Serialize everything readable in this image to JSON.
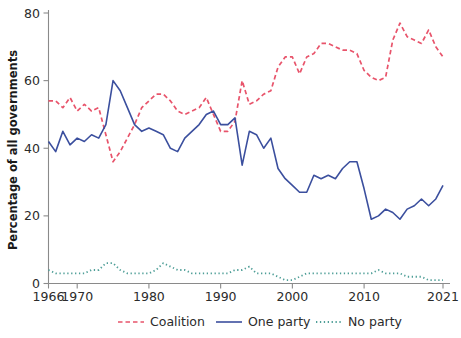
{
  "chart_data": {
    "type": "line",
    "title": "",
    "xlabel": "",
    "ylabel": "Percentage of all governments",
    "xlim": [
      1966,
      2021
    ],
    "ylim": [
      0,
      80
    ],
    "grid": false,
    "legend_position": "bottom",
    "x_ticks": [
      "1966",
      "1970",
      "1980",
      "1990",
      "2000",
      "2010",
      "2021"
    ],
    "x_tick_values": [
      1966,
      1970,
      1980,
      1990,
      2000,
      2010,
      2021
    ],
    "y_ticks": [
      "0",
      "20",
      "40",
      "60",
      "80"
    ],
    "y_tick_values": [
      0,
      20,
      40,
      60,
      80
    ],
    "x": [
      1966,
      1967,
      1968,
      1969,
      1970,
      1971,
      1972,
      1973,
      1974,
      1975,
      1976,
      1977,
      1978,
      1979,
      1980,
      1981,
      1982,
      1983,
      1984,
      1985,
      1986,
      1987,
      1988,
      1989,
      1990,
      1991,
      1992,
      1993,
      1994,
      1995,
      1996,
      1997,
      1998,
      1999,
      2000,
      2001,
      2002,
      2003,
      2004,
      2005,
      2006,
      2007,
      2008,
      2009,
      2010,
      2011,
      2012,
      2013,
      2014,
      2015,
      2016,
      2017,
      2018,
      2019,
      2020,
      2021
    ],
    "series": [
      {
        "name": "Coalition",
        "color": "#e8546b",
        "style": "dashed",
        "values": [
          54,
          54,
          52,
          55,
          51,
          53,
          51,
          52,
          44,
          36,
          39,
          43,
          47,
          52,
          54,
          56,
          56,
          54,
          51,
          50,
          51,
          52,
          55,
          50,
          45,
          45,
          48,
          60,
          53,
          54,
          56,
          57,
          64,
          67,
          67,
          62,
          67,
          68,
          71,
          71,
          70,
          69,
          69,
          68,
          63,
          61,
          60,
          61,
          72,
          77,
          73,
          72,
          71,
          75,
          70,
          67
        ]
      },
      {
        "name": "One party",
        "color": "#3b4f9e",
        "style": "solid",
        "values": [
          42,
          39,
          45,
          41,
          43,
          42,
          44,
          43,
          47,
          60,
          57,
          52,
          47,
          45,
          46,
          45,
          44,
          40,
          39,
          43,
          45,
          47,
          50,
          51,
          47,
          47,
          49,
          35,
          45,
          44,
          40,
          43,
          34,
          31,
          29,
          27,
          27,
          32,
          31,
          32,
          31,
          34,
          36,
          36,
          28,
          19,
          20,
          22,
          21,
          19,
          22,
          23,
          25,
          23,
          25,
          29
        ]
      },
      {
        "name": "No party",
        "color": "#4e9e97",
        "style": "dotted",
        "values": [
          4,
          3,
          3,
          3,
          3,
          3,
          4,
          4,
          6,
          6,
          4,
          3,
          3,
          3,
          3,
          4,
          6,
          5,
          4,
          4,
          3,
          3,
          3,
          3,
          3,
          3,
          4,
          4,
          5,
          3,
          3,
          3,
          2,
          1,
          1,
          2,
          3,
          3,
          3,
          3,
          3,
          3,
          3,
          3,
          3,
          3,
          4,
          3,
          3,
          3,
          2,
          2,
          2,
          1,
          1,
          1
        ]
      }
    ]
  },
  "legend": {
    "items": [
      {
        "label": "Coalition",
        "color": "#e8546b",
        "style": "dashed"
      },
      {
        "label": "One party",
        "color": "#3b4f9e",
        "style": "solid"
      },
      {
        "label": "No party",
        "color": "#4e9e97",
        "style": "dotted"
      }
    ]
  }
}
